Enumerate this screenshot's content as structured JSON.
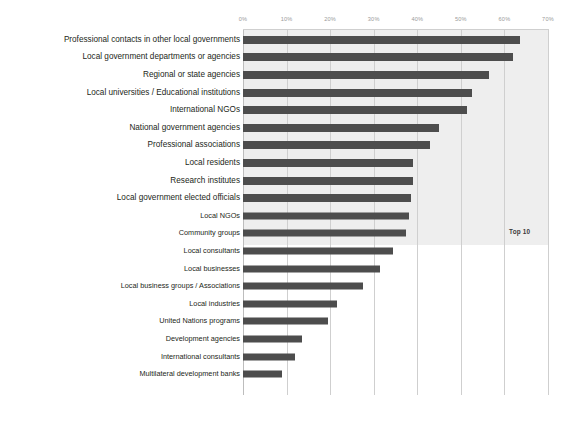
{
  "chart_data": {
    "type": "bar",
    "orientation": "horizontal",
    "title": "",
    "subtitle": "",
    "xlabel": "",
    "ylabel": "",
    "xlim": [
      0,
      70
    ],
    "grid": true,
    "legend": false,
    "tick_labels": [
      "0%",
      "10%",
      "20%",
      "30%",
      "40%",
      "50%",
      "60%",
      "70%"
    ],
    "tick_values": [
      0,
      10,
      20,
      30,
      40,
      50,
      60,
      70
    ],
    "categories": [
      "Professional contacts in other local governments",
      "Local government departments or agencies",
      "Regional or state agencies",
      "Local universities / Educational institutions",
      "International NGOs",
      "National government agencies",
      "Professional associations",
      "Local  residents",
      "Research institutes",
      "Local government elected officials",
      "Local NGOs",
      "Community groups",
      "Local consultants",
      "Local  businesses",
      "Local business  groups / Associations",
      "Local industries",
      "United Nations programs",
      "Development agencies",
      "International consultants",
      "Multilateral development banks"
    ],
    "values": [
      63.5,
      62.0,
      56.5,
      52.5,
      51.5,
      45.0,
      43.0,
      39.0,
      39.0,
      38.5,
      38.0,
      37.5,
      34.5,
      31.5,
      27.5,
      21.5,
      19.5,
      13.5,
      12.0,
      9.0
    ],
    "annotations": [
      {
        "text": "Top 10",
        "x": 66,
        "y_category_index": 9
      }
    ],
    "highlight_band": {
      "label": "Top 10",
      "from_category_index": 0,
      "to_category_index": 9,
      "color": "#eeeeee"
    },
    "colors": {
      "bar": "#4d4d4d",
      "gridline": "#cfcfcf",
      "band": "#eeeeee",
      "tick_label": "#9a9a9a",
      "category_label": "#231f20",
      "background": "#ffffff"
    }
  }
}
